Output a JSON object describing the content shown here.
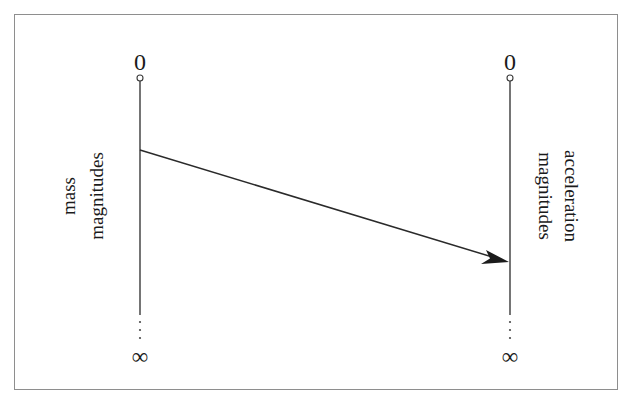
{
  "figure": {
    "background_color": "#ffffff",
    "border_color": "#8e8e8e",
    "ink_color": "#1b1b1b"
  },
  "left_scale": {
    "name": "mass-magnitudes-scale",
    "top_label": "0",
    "bottom_label": "∞",
    "title_line1": "mass",
    "title_line2": "magnitudes",
    "orientation": "bottom-to-top",
    "axis_x": 140,
    "axis_top_y": 78,
    "axis_solid_bottom_y": 315,
    "axis_dotted_bottom_y": 340
  },
  "right_scale": {
    "name": "acceleration-magnitudes-scale",
    "top_label": "0",
    "bottom_label": "∞",
    "title_line1": "acceleration",
    "title_line2": "magnitudes",
    "orientation": "top-to-bottom",
    "axis_x": 510,
    "axis_top_y": 78,
    "axis_solid_bottom_y": 315,
    "axis_dotted_bottom_y": 340
  },
  "mapping_arrow": {
    "name": "mass-to-acceleration-arrow",
    "from_x": 140,
    "from_y": 150,
    "to_x": 509,
    "to_y": 262,
    "style": "solid-line-with-filled-arrowhead"
  },
  "markers": {
    "zero_marker_shape": "open-circle",
    "zero_marker_radius": 3,
    "dot_count": 3
  }
}
